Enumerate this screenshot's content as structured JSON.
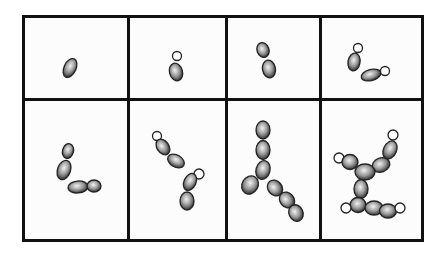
{
  "diagram": {
    "grid": {
      "rows": 2,
      "cols": 4
    },
    "colors": {
      "border": "#111111",
      "cell_outline": "#222222",
      "cell_fill": "#bfbfbf",
      "bud_fill": "#ffffff"
    },
    "panels": [
      {
        "id": 1,
        "row": 1,
        "col": 1,
        "description": "single cell"
      },
      {
        "id": 2,
        "row": 1,
        "col": 2,
        "description": "cell with small bud"
      },
      {
        "id": 3,
        "row": 1,
        "col": 3,
        "description": "two cells (mother and daughter)"
      },
      {
        "id": 4,
        "row": 1,
        "col": 4,
        "description": "two cells each with a bud"
      },
      {
        "id": 5,
        "row": 2,
        "col": 1,
        "description": "four cells"
      },
      {
        "id": 6,
        "row": 2,
        "col": 2,
        "description": "four cells with two buds"
      },
      {
        "id": 7,
        "row": 2,
        "col": 3,
        "description": "eight-cell chains"
      },
      {
        "id": 8,
        "row": 2,
        "col": 4,
        "description": "branched colony with buds"
      }
    ]
  }
}
